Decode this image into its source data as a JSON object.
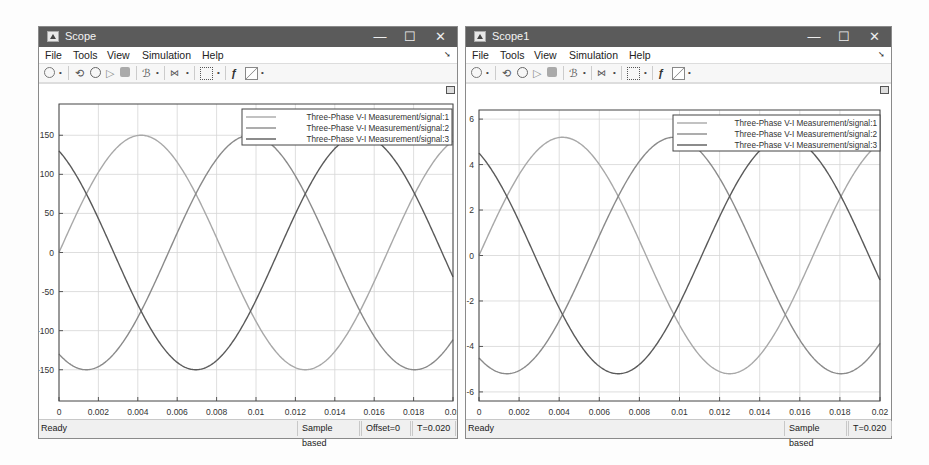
{
  "windows": [
    {
      "title": "Scope",
      "controls": {
        "minimize": "—",
        "maximize": "☐",
        "close": "✕"
      },
      "menu": [
        "File",
        "Tools",
        "View",
        "Simulation",
        "Help"
      ],
      "toolbar": [
        "settings-icon",
        "dropdown",
        "step-back-icon",
        "run-icon",
        "step-forward-icon",
        "stop-icon",
        "highlight-simulink-block-icon",
        "dropdown",
        "triggers-icon",
        "dropdown",
        "zoom-icon",
        "dropdown",
        "autoscale-icon",
        "style-icon",
        "dropdown"
      ],
      "status": {
        "ready": "Ready",
        "mode": "Sample based",
        "offset": "Offset=0",
        "time": "T=0.020"
      },
      "legend": [
        "Three-Phase V-I Measurement/signal:1",
        "Three-Phase V-I Measurement/signal:2",
        "Three-Phase V-I Measurement/signal:3"
      ]
    },
    {
      "title": "Scope1",
      "controls": {
        "minimize": "—",
        "maximize": "☐",
        "close": "✕"
      },
      "menu": [
        "File",
        "Tools",
        "View",
        "Simulation",
        "Help"
      ],
      "toolbar": [
        "settings-icon",
        "dropdown",
        "step-back-icon",
        "run-icon",
        "step-forward-icon",
        "stop-icon",
        "highlight-simulink-block-icon",
        "dropdown",
        "triggers-icon",
        "dropdown",
        "zoom-icon",
        "dropdown",
        "autoscale-icon",
        "style-icon",
        "dropdown"
      ],
      "status": {
        "ready": "Ready",
        "mode": "Sample based",
        "time": "T=0.020"
      },
      "legend": [
        "Three-Phase V-I Measurement/signal:1",
        "Three-Phase V-I Measurement/signal:2",
        "Three-Phase V-I Measurement/signal:3"
      ]
    }
  ],
  "chart_data": [
    {
      "type": "line",
      "title": "Scope",
      "xlabel": "",
      "ylabel": "",
      "xlim": [
        0,
        0.02
      ],
      "ylim": [
        -190,
        190
      ],
      "xticks": [
        "0",
        "0.002",
        "0.004",
        "0.006",
        "0.008",
        "0.01",
        "0.012",
        "0.014",
        "0.016",
        "0.018",
        "0.02"
      ],
      "yticks": [
        "150",
        "100",
        "50",
        "0",
        "-50",
        "-100",
        "-150"
      ],
      "ytick_values": [
        150,
        100,
        50,
        0,
        -50,
        -100,
        -150
      ],
      "grid": true,
      "legend_position": "top-right",
      "frequency_hz": 60,
      "series": [
        {
          "name": "Three-Phase V-I Measurement/signal:1",
          "amplitude": 150,
          "phase_deg": 0,
          "color": "#a8a8a8"
        },
        {
          "name": "Three-Phase V-I Measurement/signal:2",
          "amplitude": 150,
          "phase_deg": -120,
          "color": "#8a8a8a"
        },
        {
          "name": "Three-Phase V-I Measurement/signal:3",
          "amplitude": 150,
          "phase_deg": 120,
          "color": "#5a5a5a"
        }
      ]
    },
    {
      "type": "line",
      "title": "Scope1",
      "xlabel": "",
      "ylabel": "",
      "xlim": [
        0,
        0.02
      ],
      "ylim": [
        -6.4,
        6.4
      ],
      "xticks": [
        "0",
        "0.002",
        "0.004",
        "0.006",
        "0.008",
        "0.01",
        "0.012",
        "0.014",
        "0.016",
        "0.018",
        "0.02"
      ],
      "yticks": [
        "6",
        "4",
        "2",
        "0",
        "-2",
        "-4",
        "-6"
      ],
      "ytick_values": [
        6,
        4,
        2,
        0,
        -2,
        -4,
        -6
      ],
      "grid": true,
      "legend_position": "top-right",
      "frequency_hz": 60,
      "series": [
        {
          "name": "Three-Phase V-I Measurement/signal:1",
          "amplitude": 5.2,
          "phase_deg": 0,
          "color": "#a8a8a8"
        },
        {
          "name": "Three-Phase V-I Measurement/signal:2",
          "amplitude": 5.2,
          "phase_deg": -120,
          "color": "#8a8a8a"
        },
        {
          "name": "Three-Phase V-I Measurement/signal:3",
          "amplitude": 5.2,
          "phase_deg": 120,
          "color": "#5a5a5a"
        }
      ]
    }
  ]
}
